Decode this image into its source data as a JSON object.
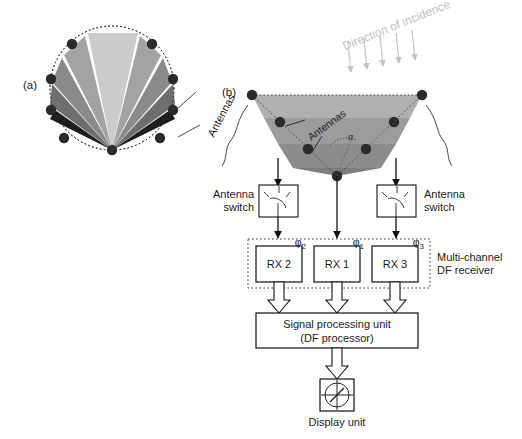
{
  "figure": {
    "panels": [
      {
        "tag": "(a)",
        "name": "circular-antenna-array"
      },
      {
        "tag": "(b)",
        "name": "df-system-block-diagram"
      }
    ]
  },
  "panel_a": {
    "tag": "(a)",
    "antennas_label": "Antennas",
    "antenna_count": 9,
    "beam_wedge_count": 7,
    "wedge_colors": [
      "#cfcfcf",
      "#bdbdbd",
      "#a8a8a8",
      "#8f8f8f",
      "#7a7a7a",
      "#4a4a4a",
      "#1e1e1e"
    ],
    "dot_color": "#2b2b2b",
    "circle_style": "dotted"
  },
  "panel_b": {
    "tag": "(b)",
    "antennas_label": "Antennas",
    "direction_label": "Direction of incidence",
    "direction_arrow_count": 5,
    "direction_arrow_color": "#c2c2c2",
    "angle_label": "α",
    "antenna_switch_left_label": "Antenna\nswitch",
    "antenna_switch_right_label": "Antenna\nswitch",
    "phase_labels": [
      "φ",
      "φ",
      "φ"
    ],
    "phase_subscripts": [
      "2",
      "1",
      "3"
    ],
    "receivers": [
      {
        "label": "RX 2"
      },
      {
        "label": "RX 1"
      },
      {
        "label": "RX 3"
      }
    ],
    "receiver_group_label": "Multi-channel\nDF receiver",
    "processor_label_line1": "Signal processing unit",
    "processor_label_line2": "(DF processor)",
    "display_label": "Display unit",
    "array_fill_top": "#adadad",
    "array_fill_mid": "#9a9a9a",
    "array_fill_low": "#8a8a8a",
    "array_fill_apex": "#7c7c7c"
  }
}
